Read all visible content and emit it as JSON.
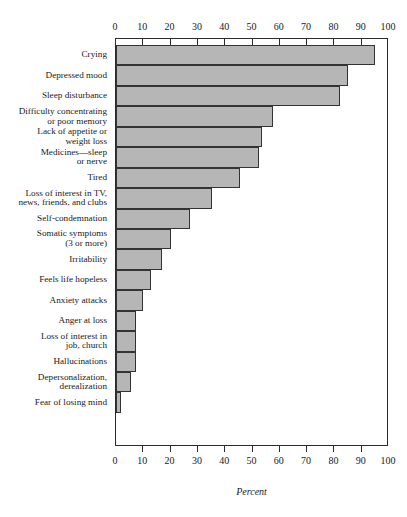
{
  "chart_data": {
    "type": "bar",
    "orientation": "horizontal",
    "title": "",
    "xlabel": "Percent",
    "ylabel": "",
    "xlim": [
      0,
      100
    ],
    "xticks": [
      0,
      10,
      20,
      30,
      40,
      50,
      60,
      70,
      80,
      90,
      100
    ],
    "tick_labels": [
      "0",
      "10",
      "20",
      "30",
      "40",
      "50",
      "60",
      "70",
      "80",
      "90",
      "100"
    ],
    "grid": false,
    "legend": "none",
    "axis_top": true,
    "axis_bottom": true,
    "bar_fill_color": "#b6b6b6",
    "bar_edge_color": "#333333",
    "categories": [
      "Crying",
      "Depressed mood",
      "Sleep disturbance",
      "Difficulty concentrating\nor poor memory",
      "Lack of appetite or\nweight loss",
      "Medicines—sleep\nor nerve",
      "Tired",
      "Loss of interest in TV,\nnews, friends, and clubs",
      "Self-condemnation",
      "Somatic symptoms\n(3 or more)",
      "Irritability",
      "Feels life hopeless",
      "Anxiety attacks",
      "Anger at loss",
      "Loss of interest in\njob, church",
      "Hallucinations",
      "Depersonalization,\nderealization",
      "Fear of losing mind"
    ],
    "values": [
      95,
      85,
      82,
      57.5,
      53.5,
      52.5,
      45.5,
      35,
      27,
      20,
      17,
      13,
      10,
      7.5,
      7.5,
      7.5,
      5.5,
      2
    ]
  }
}
